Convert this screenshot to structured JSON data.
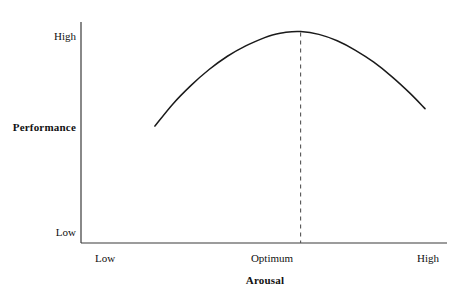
{
  "chart_data": {
    "type": "line",
    "title": "",
    "subtitle": "",
    "xlabel": "Arousal",
    "ylabel": "Performance",
    "xtick_labels": [
      "Low",
      "Optimum",
      "High"
    ],
    "ytick_labels": [
      "Low",
      "High"
    ],
    "xlim_labels": [
      "Low",
      "High"
    ],
    "ylim_labels": [
      "Low",
      "High"
    ],
    "grid": false,
    "legend": false,
    "legend_position": "none",
    "annotations": [
      {
        "name": "optimum-dashed-line",
        "kind": "vertical-dashed-line",
        "at_x_label": "Optimum",
        "from_y_label": "peak",
        "to_y_label": "axis"
      }
    ],
    "series": [
      {
        "name": "Performance vs Arousal",
        "shape": "inverted-u",
        "color": "#1a1a1a",
        "line_width": 1.5,
        "points": [
          {
            "x": 0.202,
            "y": 0.529
          },
          {
            "x": 0.25,
            "y": 0.627
          },
          {
            "x": 0.3,
            "y": 0.712
          },
          {
            "x": 0.35,
            "y": 0.785
          },
          {
            "x": 0.4,
            "y": 0.845
          },
          {
            "x": 0.45,
            "y": 0.892
          },
          {
            "x": 0.5,
            "y": 0.928
          },
          {
            "x": 0.523,
            "y": 0.941
          },
          {
            "x": 0.56,
            "y": 0.954
          },
          {
            "x": 0.6,
            "y": 0.957
          },
          {
            "x": 0.65,
            "y": 0.944
          },
          {
            "x": 0.7,
            "y": 0.915
          },
          {
            "x": 0.75,
            "y": 0.872
          },
          {
            "x": 0.8,
            "y": 0.818
          },
          {
            "x": 0.85,
            "y": 0.752
          },
          {
            "x": 0.9,
            "y": 0.676
          },
          {
            "x": 0.94,
            "y": 0.608
          }
        ],
        "peak": {
          "x_label": "Optimum",
          "y_label": "near High"
        }
      }
    ],
    "axis_color": "#3a3a3a",
    "background_color": "#ffffff"
  },
  "axes": {
    "y_title": "Performance",
    "y_ticks": {
      "high": "High",
      "low": "Low"
    },
    "x_title": "Arousal",
    "x_ticks": {
      "low": "Low",
      "optimum": "Optimum",
      "high": "High"
    }
  }
}
